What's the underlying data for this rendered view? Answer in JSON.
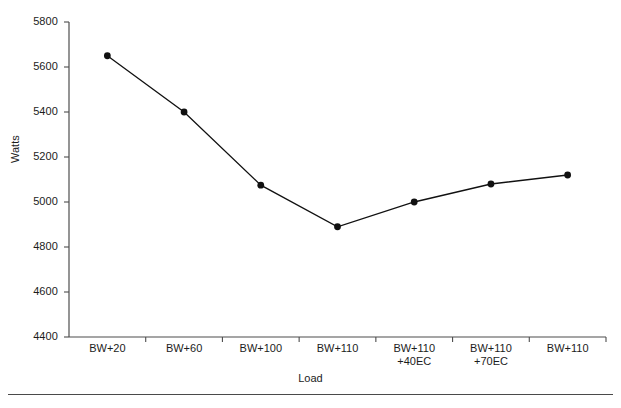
{
  "chart_data": {
    "type": "line",
    "title": "",
    "xlabel": "Load",
    "ylabel": "Watts",
    "categories": [
      "BW+20",
      "BW+60",
      "BW+100",
      "BW+110",
      "BW+110\n+40EC",
      "BW+110\n+70EC",
      "BW+110"
    ],
    "category_lines": [
      [
        "BW+20"
      ],
      [
        "BW+60"
      ],
      [
        "BW+100"
      ],
      [
        "BW+110"
      ],
      [
        "BW+110",
        "+40EC"
      ],
      [
        "BW+110",
        "+70EC"
      ],
      [
        "BW+110"
      ]
    ],
    "values": [
      5650,
      5400,
      5075,
      4890,
      5000,
      5080,
      5120
    ],
    "ylim": [
      4400,
      5800
    ],
    "ytick_labels": [
      "5800",
      "5600",
      "5400",
      "5200",
      "5000",
      "4800",
      "4600",
      "4400"
    ],
    "ytick_values": [
      5800,
      5600,
      5400,
      5200,
      5000,
      4800,
      4600,
      4400
    ],
    "grid": false,
    "legend": "none",
    "marker": "filled-circle",
    "series_color": "#111111",
    "axis_color": "#4d4d4d"
  },
  "axis_titles": {
    "x": "Load",
    "y": "Watts"
  },
  "footer": {
    "rule_color": "#4a4a4a"
  }
}
